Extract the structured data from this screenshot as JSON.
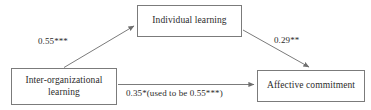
{
  "diagram": {
    "type": "mediation-path-diagram",
    "background_color": "#ffffff",
    "line_color": "#7b7b7b",
    "text_color": "#2b2b2b",
    "nodes": [
      {
        "id": "individual-learning",
        "label": "Individual learning"
      },
      {
        "id": "inter-organizational-learning",
        "label": "Inter-organizational\nlearning"
      },
      {
        "id": "affective-commitment",
        "label": "Affective commitment"
      }
    ],
    "paths": [
      {
        "id": "a-path",
        "from": "inter-organizational-learning",
        "to": "individual-learning",
        "coefficient": "0.55***"
      },
      {
        "id": "b-path",
        "from": "individual-learning",
        "to": "affective-commitment",
        "coefficient": "0.29**"
      },
      {
        "id": "c-path",
        "from": "inter-organizational-learning",
        "to": "affective-commitment",
        "coefficient": "0.35*(used to be 0.55***)"
      }
    ]
  }
}
